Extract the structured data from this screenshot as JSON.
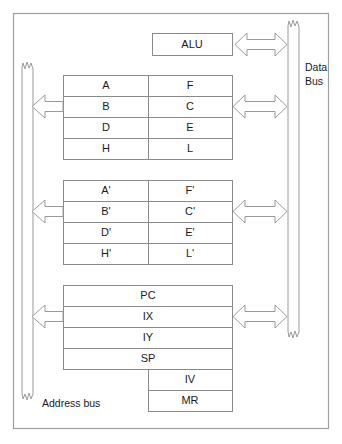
{
  "diagram": {
    "background_color": "#ffffff",
    "line_color": "#8a8a8a",
    "text_color": "#1a1a1a"
  },
  "alu": {
    "label": "ALU"
  },
  "buses": {
    "data_bus": {
      "label_line1": "Data",
      "label_line2": "Bus"
    },
    "address_bus": {
      "label": "Address bus"
    }
  },
  "register_sets": [
    {
      "name": "main-register-set",
      "rows": [
        {
          "left": "A",
          "right": "F"
        },
        {
          "left": "B",
          "right": "C"
        },
        {
          "left": "D",
          "right": "E"
        },
        {
          "left": "H",
          "right": "L"
        }
      ]
    },
    {
      "name": "alternate-register-set",
      "rows": [
        {
          "left": "A'",
          "right": "F'"
        },
        {
          "left": "B'",
          "right": "C'"
        },
        {
          "left": "D'",
          "right": "E'"
        },
        {
          "left": "H'",
          "right": "L'"
        }
      ]
    }
  ],
  "special_registers": {
    "wide": [
      "PC",
      "IX",
      "IY",
      "SP"
    ],
    "narrow": [
      "IV",
      "MR"
    ]
  },
  "arrows": {
    "left_single": "arrow-left",
    "right_double": "arrow-left-right"
  }
}
